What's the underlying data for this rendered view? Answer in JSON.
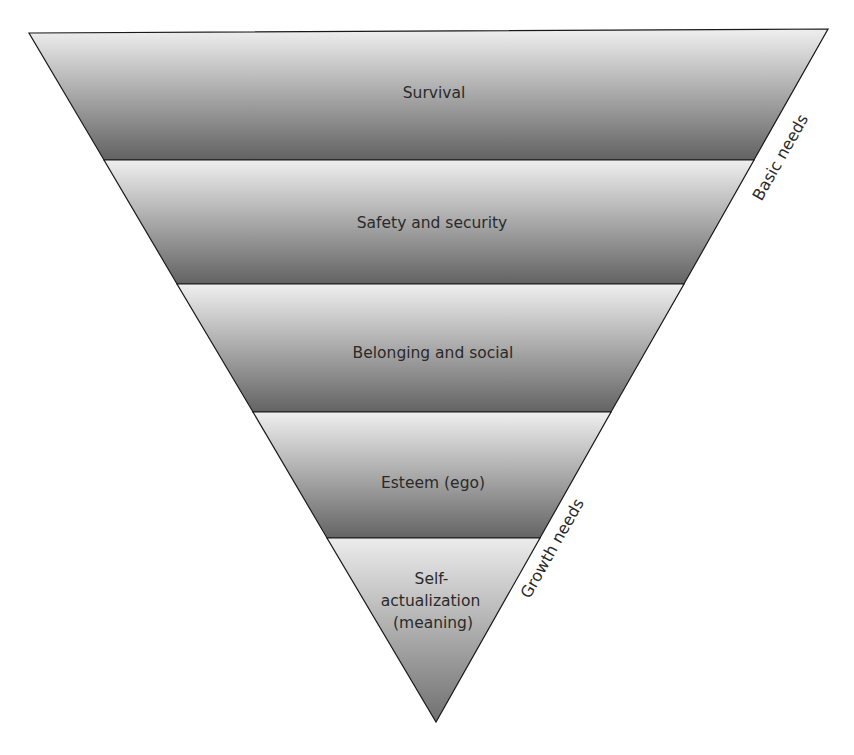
{
  "diagram": {
    "type": "inverted-pyramid",
    "title": "",
    "colors": {
      "gradient_top": "#efefef",
      "gradient_bottom": "#626262",
      "outline": "#1a1a1a",
      "text": "#2a2a2a"
    },
    "levels": [
      {
        "label": "Survival"
      },
      {
        "label": "Safety and security"
      },
      {
        "label": "Belonging and social"
      },
      {
        "label": "Esteem (ego)"
      },
      {
        "label_lines": [
          "Self-",
          "actualization",
          "(meaning)"
        ]
      }
    ],
    "side_labels": {
      "basic": "Basic needs",
      "growth": "Growth needs"
    }
  }
}
